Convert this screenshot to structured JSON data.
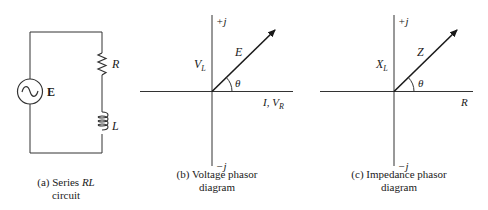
{
  "panels": [
    {
      "id": "a",
      "caption_line1_prefix": "(a) Series ",
      "caption_line1_italic": "RL",
      "caption_line2": "circuit",
      "labels": {
        "source": "E",
        "resistor": "R",
        "inductor": "L"
      },
      "source_icon": "ac-source-icon"
    },
    {
      "id": "b",
      "caption_line1": "(b) Voltage phasor",
      "caption_line2": "diagram",
      "labels": {
        "pos_imag": "+j",
        "neg_imag": "−j",
        "phasor": "E",
        "vertical_main": "V",
        "vertical_sub": "L",
        "angle": "θ",
        "horizontal_main": "I, V",
        "horizontal_sub": "R"
      }
    },
    {
      "id": "c",
      "caption_line1": "(c) Impedance phasor",
      "caption_line2": "diagram",
      "labels": {
        "pos_imag": "+j",
        "neg_imag": "−j",
        "phasor": "Z",
        "vertical_main": "X",
        "vertical_sub": "L",
        "angle": "θ",
        "horizontal": "R"
      }
    }
  ],
  "colors": {
    "line": "#1a1a1a",
    "background": "#ffffff"
  }
}
